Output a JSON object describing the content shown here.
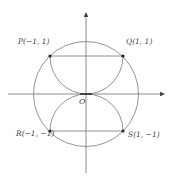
{
  "diagram": {
    "colors": {
      "stroke": "#7a7a7a",
      "axis": "#6e6e6e",
      "point": "#222222",
      "text": "#444444"
    },
    "origin_label": "O",
    "points": [
      {
        "id": "P",
        "label": "P(−1, 1)"
      },
      {
        "id": "Q",
        "label": "Q(1, 1)"
      },
      {
        "id": "R",
        "label": "R(−1, −1)"
      },
      {
        "id": "S",
        "label": "S(1, −1)"
      }
    ],
    "shapes": [
      "outer-circle",
      "upper-semicircle-arc",
      "lower-semicircle-arc",
      "segment-PQ",
      "segment-RS",
      "x-axis",
      "y-axis"
    ]
  }
}
